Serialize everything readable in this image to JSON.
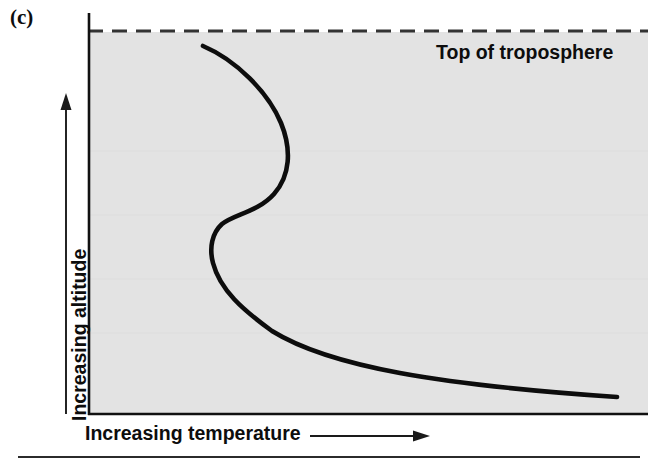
{
  "figure": {
    "panel_label": "(c)",
    "top_annotation": "Top of troposphere",
    "y_axis_label": "Increasing altitude",
    "x_axis_label": "Increasing temperature"
  },
  "colors": {
    "plot_background": "#e3e3e3",
    "axis_line": "#111111",
    "curve": "#0d0d0d",
    "dashed_line": "#333333",
    "text": "#0d0d0d",
    "page_background": "#ffffff",
    "footer_rule": "#2b2b2b"
  },
  "chart_data": {
    "type": "line",
    "title": "",
    "subtitle": "",
    "xlabel": "Increasing temperature",
    "ylabel": "Increasing altitude",
    "xlim": [
      0,
      1
    ],
    "ylim": [
      0,
      1
    ],
    "grid": false,
    "legend": null,
    "axis_ticks": {
      "x": [],
      "y": []
    },
    "axis_arrows": {
      "x": "rightward arrow below axis indicating increasing temperature",
      "y": "upward arrow left of axis indicating increasing altitude"
    },
    "annotations": [
      {
        "text": "Top of troposphere",
        "position": "top-right, just under the dashed boundary line"
      }
    ],
    "reference_lines": [
      {
        "orientation": "horizontal",
        "style": "dashed",
        "label": "Top of troposphere",
        "y_normalized": 1.0
      }
    ],
    "series": [
      {
        "name": "Temperature profile (inversion aloft)",
        "description": "Temperature decreases with altitude near the surface, then an S-shaped inversion layer aloft where temperature increases then decreases again toward the tropopause",
        "points_normalized": [
          {
            "x": 0.955,
            "y": 0.045
          },
          {
            "x": 0.86,
            "y": 0.085
          },
          {
            "x": 0.74,
            "y": 0.135
          },
          {
            "x": 0.62,
            "y": 0.195
          },
          {
            "x": 0.505,
            "y": 0.265
          },
          {
            "x": 0.4,
            "y": 0.345
          },
          {
            "x": 0.31,
            "y": 0.43
          },
          {
            "x": 0.248,
            "y": 0.51
          },
          {
            "x": 0.219,
            "y": 0.565
          },
          {
            "x": 0.222,
            "y": 0.62
          },
          {
            "x": 0.258,
            "y": 0.672
          },
          {
            "x": 0.318,
            "y": 0.715
          },
          {
            "x": 0.366,
            "y": 0.76
          },
          {
            "x": 0.382,
            "y": 0.818
          },
          {
            "x": 0.352,
            "y": 0.876
          },
          {
            "x": 0.29,
            "y": 0.925
          },
          {
            "x": 0.205,
            "y": 0.963
          }
        ]
      }
    ]
  },
  "geometry": {
    "plot_left": 88,
    "plot_right": 648,
    "plot_top": 32,
    "plot_bottom": 414,
    "dashed_line_y": 31,
    "footer_rule_y": 457
  }
}
